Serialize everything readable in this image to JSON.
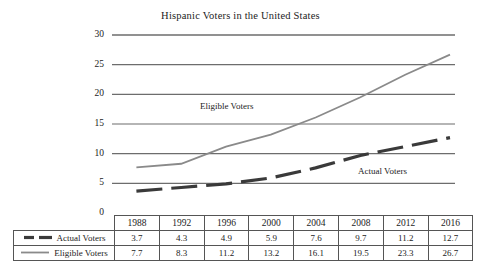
{
  "chart_data": {
    "type": "line",
    "title": "Hispanic Voters in the United States",
    "xlabel": "",
    "ylabel": "",
    "categories": [
      "1988",
      "1992",
      "1996",
      "2000",
      "2004",
      "2008",
      "2012",
      "2016"
    ],
    "ylim": [
      0,
      30
    ],
    "ytick_values": [
      30,
      25,
      20,
      15,
      10,
      5,
      0
    ],
    "yticks": [
      "30",
      "25",
      "20",
      "15",
      "10",
      "5",
      "0"
    ],
    "grid": true,
    "legend_position": "table-below",
    "series": [
      {
        "name": "Actual Voters",
        "values": [
          3.7,
          4.3,
          4.9,
          5.9,
          7.6,
          9.7,
          11.2,
          12.7
        ],
        "style": "dashed",
        "color": "#3a3a3a",
        "width": 3.2
      },
      {
        "name": "Eligible Voters",
        "values": [
          7.7,
          8.3,
          11.2,
          13.2,
          16.1,
          19.5,
          23.3,
          26.7
        ],
        "style": "solid",
        "color": "#8a8a8a",
        "width": 1.8
      }
    ],
    "annotations": [
      {
        "text": "Eligible Voters",
        "series": "Eligible Voters"
      },
      {
        "text": "Actual Voters",
        "series": "Actual Voters"
      }
    ]
  },
  "table": {
    "legend_header": "",
    "year_headers": [
      "1988",
      "1992",
      "1996",
      "2000",
      "2004",
      "2008",
      "2012",
      "2016"
    ],
    "rows": [
      {
        "label": "Actual Voters",
        "values": [
          "3.7",
          "4.3",
          "4.9",
          "5.9",
          "7.6",
          "9.7",
          "11.2",
          "12.7"
        ]
      },
      {
        "label": "Eligible Voters",
        "values": [
          "7.7",
          "8.3",
          "11.2",
          "13.2",
          "16.1",
          "19.5",
          "23.3",
          "26.7"
        ]
      }
    ]
  },
  "colors": {
    "actual": "#3a3a3a",
    "eligible": "#8a8a8a",
    "grid": "#6d6d6d",
    "text": "#1c1c1c",
    "table_border": "#555555",
    "background": "#ffffff"
  }
}
